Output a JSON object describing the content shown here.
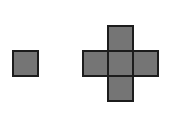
{
  "canvas": {
    "width": 182,
    "height": 135,
    "background_color": "#ffffff"
  },
  "style": {
    "fill_color": "#757575",
    "border_color": "#1c1c1c",
    "border_width": 2,
    "cell_size": 27
  },
  "shapes": [
    {
      "name": "single-square",
      "kind": "square",
      "cell_count": 1,
      "x": 12,
      "y": 50,
      "width": 27,
      "height": 27,
      "grid_columns": 1,
      "grid_rows": 1,
      "filled_cells": [
        [
          0,
          0
        ]
      ]
    },
    {
      "name": "plus-cross",
      "kind": "plus",
      "cell_count": 5,
      "x": 82,
      "y": 25,
      "width": 81,
      "height": 81,
      "grid_columns": 3,
      "grid_rows": 3,
      "filled_cells": [
        [
          1,
          0
        ],
        [
          0,
          1
        ],
        [
          1,
          1
        ],
        [
          2,
          1
        ],
        [
          1,
          2
        ]
      ]
    }
  ]
}
